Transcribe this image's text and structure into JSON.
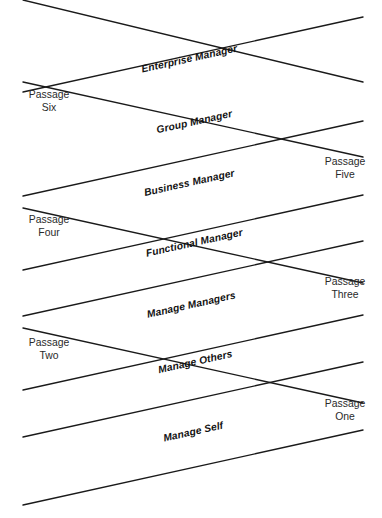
{
  "diagram": {
    "type": "crossing-lines-diagram",
    "canvas": {
      "width": 382,
      "height": 518
    },
    "colors": {
      "background": "#ffffff",
      "line": "#1a1a1a",
      "role_text": "#121212",
      "passage_text": "#2a2a2a"
    },
    "roles": [
      {
        "id": "enterprise-manager",
        "label": "Enterprise Manager",
        "direction": "ascending",
        "x1": 23,
        "y1": 92,
        "x2": 363,
        "y2": 17,
        "label_anchor_x": 190,
        "label_anchor_y": 62,
        "angle": -12.5
      },
      {
        "id": "group-manager",
        "label": "Group Manager",
        "direction": "ascending",
        "x1": 23,
        "y1": 196,
        "x2": 363,
        "y2": 121,
        "label_anchor_x": 195,
        "label_anchor_y": 125,
        "angle": -12.5
      },
      {
        "id": "business-manager",
        "label": "Business Manager",
        "direction": "ascending",
        "x1": 23,
        "y1": 270,
        "x2": 363,
        "y2": 195,
        "label_anchor_x": 190,
        "label_anchor_y": 186,
        "angle": -12.5
      },
      {
        "id": "functional-manager",
        "label": "Functional Manager",
        "direction": "ascending",
        "x1": 23,
        "y1": 316,
        "x2": 363,
        "y2": 241,
        "label_anchor_x": 195,
        "label_anchor_y": 246,
        "angle": -12.5
      },
      {
        "id": "manage-managers",
        "label": "Manage Managers",
        "direction": "ascending",
        "x1": 23,
        "y1": 390,
        "x2": 363,
        "y2": 315,
        "label_anchor_x": 192,
        "label_anchor_y": 308,
        "angle": -12.5
      },
      {
        "id": "manage-others",
        "label": "Manage Others",
        "direction": "ascending",
        "x1": 23,
        "y1": 437,
        "x2": 363,
        "y2": 362,
        "label_anchor_x": 196,
        "label_anchor_y": 365,
        "angle": -12.5
      },
      {
        "id": "manage-self",
        "label": "Manage Self",
        "direction": "ascending",
        "x1": 23,
        "y1": 505,
        "x2": 363,
        "y2": 430,
        "label_anchor_x": 194,
        "label_anchor_y": 435,
        "angle": -12.5
      }
    ],
    "descenders": [
      {
        "id": "descender-top",
        "x1": 23,
        "y1": 82,
        "x2": 363,
        "y2": 157
      },
      {
        "id": "descender-upper",
        "x1": 23,
        "y1": 0,
        "x2": 363,
        "y2": 82
      },
      {
        "id": "descender-mid",
        "x1": 23,
        "y1": 208,
        "x2": 363,
        "y2": 283
      },
      {
        "id": "descender-lower",
        "x1": 23,
        "y1": 328,
        "x2": 363,
        "y2": 403
      }
    ],
    "passages": [
      {
        "id": "passage-six",
        "line1": "Passage",
        "line2": "Six",
        "left": 12,
        "top": 88,
        "side": "left"
      },
      {
        "id": "passage-five",
        "line1": "Passage",
        "line2": "Five",
        "left": 308,
        "top": 155,
        "side": "right"
      },
      {
        "id": "passage-four",
        "line1": "Passage",
        "line2": "Four",
        "left": 12,
        "top": 213,
        "side": "left"
      },
      {
        "id": "passage-three",
        "line1": "Passage",
        "line2": "Three",
        "left": 308,
        "top": 275,
        "side": "right"
      },
      {
        "id": "passage-two",
        "line1": "Passage",
        "line2": "Two",
        "left": 12,
        "top": 336,
        "side": "left"
      },
      {
        "id": "passage-one",
        "line1": "Passage",
        "line2": "One",
        "left": 308,
        "top": 397,
        "side": "right"
      }
    ]
  }
}
